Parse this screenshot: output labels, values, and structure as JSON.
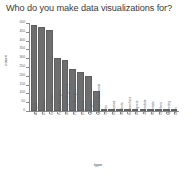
{
  "chart_data": {
    "type": "bar",
    "title": "Who do you make data visualizations for?",
    "xlabel": "type",
    "ylabel": "count",
    "ylim": [
      0,
      500
    ],
    "grid": false,
    "legend": null,
    "yticks": [
      0,
      50,
      100,
      150,
      200,
      250,
      300,
      350,
      400,
      450,
      500
    ],
    "ytick_labels": [
      "0",
      "50",
      "100",
      "150",
      "200",
      "250",
      "300",
      "350",
      "400",
      "450",
      "500"
    ],
    "categories": [
      "Analysts",
      "Executives",
      "General Public",
      "Project Managers",
      "Developers/Engineers",
      "Product Managers",
      "Engineers",
      "Managers",
      "Medical Professionals",
      "Clients",
      "Educators",
      "Students",
      "Researchers",
      "Designers",
      "Journalists",
      "Scientists",
      "Teachers",
      "Marketing",
      "Other"
    ],
    "values": [
      490,
      480,
      462,
      302,
      288,
      240,
      224,
      200,
      112,
      6,
      5,
      4,
      4,
      3,
      3,
      2,
      2,
      2,
      1
    ],
    "bar_color": "#6e6e6e"
  },
  "style": {
    "axis_color": "#8a8a8a",
    "title_color": "#3a3a3a",
    "tick_label_color": "#5a5a5a",
    "background": "#ffffff"
  }
}
